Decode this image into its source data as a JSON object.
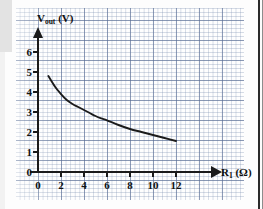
{
  "chart_data": {
    "type": "line",
    "title": "",
    "subtitle": "",
    "xlabel": "R",
    "xlabel_sub": "1",
    "xlabel_unit": "(Ω)",
    "ylabel": "V",
    "ylabel_sub": "out",
    "ylabel_unit": "(V)",
    "xlim": [
      0,
      13
    ],
    "ylim": [
      0,
      6.4
    ],
    "grid": true,
    "grid_style": "graph-paper",
    "legend": "none",
    "x_ticks": [
      "0",
      "2",
      "4",
      "6",
      "8",
      "10",
      "12"
    ],
    "x_tick_values": [
      0,
      2,
      4,
      6,
      8,
      10,
      12
    ],
    "y_ticks": [
      "0",
      "1",
      "2",
      "3",
      "4",
      "5",
      "6"
    ],
    "y_tick_values": [
      0,
      1,
      2,
      3,
      4,
      5,
      6
    ],
    "series": [
      {
        "name": "Vout vs RL",
        "x": [
          0.9,
          1.5,
          2.0,
          2.5,
          3.0,
          3.5,
          4.0,
          4.5,
          5.0,
          5.5,
          6.0,
          7.0,
          8.0,
          9.0,
          10.0,
          11.0,
          12.0
        ],
        "values": [
          4.8,
          4.25,
          3.9,
          3.6,
          3.4,
          3.25,
          3.1,
          2.95,
          2.8,
          2.68,
          2.58,
          2.35,
          2.15,
          2.0,
          1.85,
          1.7,
          1.55
        ]
      }
    ],
    "annotations": []
  },
  "axes": {
    "y_axis_name": "y-axis",
    "x_axis_name": "x-axis"
  },
  "colors": {
    "curve": "#1b1b1b",
    "axis": "#1b1b1b",
    "grid_major": "#5a6e96",
    "grid_minor": "#788caf",
    "paper": "#fefefe",
    "text": "#111111"
  }
}
